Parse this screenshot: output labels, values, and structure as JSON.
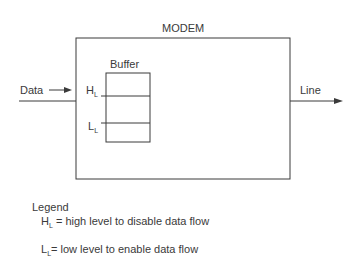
{
  "diagram": {
    "title": "MODEM",
    "buffer_label": "Buffer",
    "input_label": "Data",
    "output_label": "Line",
    "high_marker": {
      "main": "H",
      "sub": "L"
    },
    "low_marker": {
      "main": "L",
      "sub": "L"
    }
  },
  "legend": {
    "heading": "Legend",
    "items": [
      {
        "main": "H",
        "sub": "L",
        "text": " = high level to disable data flow"
      },
      {
        "main": "L",
        "sub": "L",
        "text": "= low level to enable data flow"
      }
    ]
  },
  "colors": {
    "stroke": "#3a3a3a",
    "background": "#ffffff"
  }
}
